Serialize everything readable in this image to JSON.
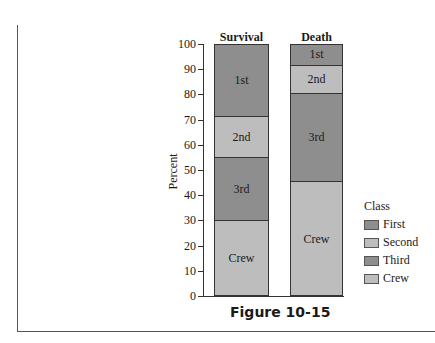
{
  "chart_data": {
    "type": "bar",
    "stacked": true,
    "percent": true,
    "title": "",
    "caption": "Figure 10-15",
    "xlabel": "",
    "ylabel": "Percent",
    "ylim": [
      0,
      100
    ],
    "yticks": [
      0,
      10,
      20,
      30,
      40,
      50,
      60,
      70,
      80,
      90,
      100
    ],
    "grid": false,
    "categories": [
      "Survival",
      "Death"
    ],
    "series": [
      {
        "name": "Crew",
        "segment_label": "Crew",
        "color": "#bdbdbd",
        "values": [
          30,
          45.5
        ]
      },
      {
        "name": "Third",
        "segment_label": "3rd",
        "color": "#8e8e8e",
        "values": [
          25,
          35
        ]
      },
      {
        "name": "Second",
        "segment_label": "2nd",
        "color": "#bdbdbd",
        "values": [
          16.5,
          11.5
        ]
      },
      {
        "name": "First",
        "segment_label": "1st",
        "color": "#8e8e8e",
        "values": [
          28.5,
          8
        ]
      }
    ],
    "legend": {
      "title": "Class",
      "position": "right",
      "entries": [
        "First",
        "Second",
        "Third",
        "Crew"
      ]
    }
  },
  "axis": {
    "ylabel": "Percent",
    "ticks": [
      "0",
      "10",
      "20",
      "30",
      "40",
      "50",
      "60",
      "70",
      "80",
      "90",
      "100"
    ]
  },
  "bars": {
    "survival": {
      "title": "Survival",
      "first": "1st",
      "second": "2nd",
      "third": "3rd",
      "crew": "Crew"
    },
    "death": {
      "title": "Death",
      "first": "1st",
      "second": "2nd",
      "third": "3rd",
      "crew": "Crew"
    }
  },
  "legend": {
    "title": "Class",
    "items": [
      {
        "label": "First",
        "color": "#8e8e8e"
      },
      {
        "label": "Second",
        "color": "#bdbdbd"
      },
      {
        "label": "Third",
        "color": "#8e8e8e"
      },
      {
        "label": "Crew",
        "color": "#bdbdbd"
      }
    ]
  },
  "caption": "Figure 10-15",
  "colors": {
    "dark": "#8e8e8e",
    "light": "#bdbdbd"
  }
}
